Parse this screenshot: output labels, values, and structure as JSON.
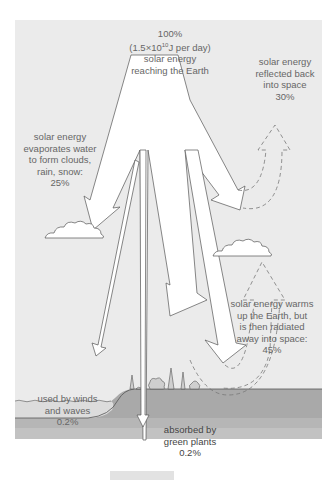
{
  "diagram": {
    "colors": {
      "panel": "#ebebeb",
      "arrow_fill": "#ffffff",
      "outline": "#555555",
      "dashed": "#777777",
      "water": "#e4e4e4",
      "ground_top": "#a8a8a8",
      "ground_mid": "#b8b8b8",
      "ground_base": "#c4c4c4"
    },
    "labels": {
      "incoming": {
        "line1": "100%",
        "line2": "(1.5×10",
        "line2_sup": "10",
        "line2_end": "J per day)",
        "line3": "solar energy",
        "line4": "reaching the Earth"
      },
      "reflected": {
        "line1": "solar energy",
        "line2": "reflected back",
        "line3": "into space",
        "line4": "30%"
      },
      "evaporation": {
        "line1": "solar energy",
        "line2": "evaporates water",
        "line3": "to form clouds,",
        "line4": "rain, snow:",
        "line5": "25%"
      },
      "radiated": {
        "line1": "solar energy warms",
        "line2": "up the Earth, but",
        "line3": "is then radiated",
        "line4": "away into space:",
        "line5": "45%"
      },
      "winds": {
        "line1": "used by winds",
        "line2": "and waves",
        "line3": "0.2%"
      },
      "plants": {
        "line1": "absorbed by",
        "line2": "green plants",
        "line3": "0.2%"
      }
    }
  }
}
